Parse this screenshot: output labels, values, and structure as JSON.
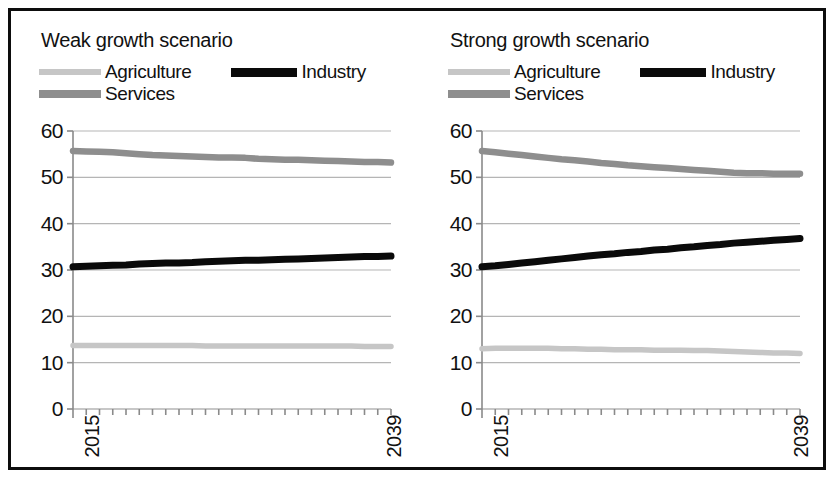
{
  "figure": {
    "panels": [
      {
        "id": "weak",
        "title": "Weak growth scenario",
        "legend": {
          "agriculture_label": "Agriculture",
          "industry_label": "Industry",
          "services_label": "Services"
        },
        "x_first_label": "2015",
        "x_last_label": "2039"
      },
      {
        "id": "strong",
        "title": "Strong growth scenario",
        "legend": {
          "agriculture_label": "Agriculture",
          "industry_label": "Industry",
          "services_label": "Services"
        },
        "x_first_label": "2015",
        "x_last_label": "2039"
      }
    ],
    "y_tick_labels": [
      "60",
      "50",
      "40",
      "30",
      "20",
      "10",
      "0"
    ],
    "colors": {
      "agriculture": "#c6c6c6",
      "industry": "#0a0a0a",
      "services": "#8e8e8e",
      "gridline": "#b5b5b5",
      "axis": "#8a8a8a",
      "frame": "#0d0d0d",
      "background": "#ffffff"
    }
  },
  "chart_data": [
    {
      "type": "line",
      "title": "Weak growth scenario",
      "xlabel": "",
      "ylabel": "",
      "xlim": [
        2015,
        2039
      ],
      "ylim": [
        0,
        60
      ],
      "yticks": [
        0,
        10,
        20,
        30,
        40,
        50,
        60
      ],
      "grid": true,
      "legend_position": "top",
      "x": [
        2015,
        2016,
        2017,
        2018,
        2019,
        2020,
        2021,
        2022,
        2023,
        2024,
        2025,
        2026,
        2027,
        2028,
        2029,
        2030,
        2031,
        2032,
        2033,
        2034,
        2035,
        2036,
        2037,
        2038,
        2039
      ],
      "series": [
        {
          "name": "Agriculture",
          "values": [
            13.7,
            13.7,
            13.7,
            13.7,
            13.7,
            13.7,
            13.7,
            13.7,
            13.7,
            13.7,
            13.6,
            13.6,
            13.6,
            13.6,
            13.6,
            13.6,
            13.6,
            13.6,
            13.6,
            13.6,
            13.6,
            13.6,
            13.5,
            13.5,
            13.5
          ]
        },
        {
          "name": "Industry",
          "values": [
            30.7,
            30.8,
            30.9,
            31.0,
            31.1,
            31.3,
            31.4,
            31.5,
            31.5,
            31.6,
            31.8,
            31.9,
            32.0,
            32.1,
            32.1,
            32.2,
            32.3,
            32.4,
            32.5,
            32.6,
            32.7,
            32.8,
            32.9,
            32.9,
            33.0
          ]
        },
        {
          "name": "Services",
          "values": [
            55.7,
            55.6,
            55.5,
            55.4,
            55.2,
            55.0,
            54.8,
            54.7,
            54.6,
            54.5,
            54.4,
            54.3,
            54.3,
            54.2,
            54.0,
            53.9,
            53.8,
            53.8,
            53.7,
            53.6,
            53.5,
            53.4,
            53.3,
            53.3,
            53.2
          ]
        }
      ]
    },
    {
      "type": "line",
      "title": "Strong growth scenario",
      "xlabel": "",
      "ylabel": "",
      "xlim": [
        2015,
        2039
      ],
      "ylim": [
        0,
        60
      ],
      "yticks": [
        0,
        10,
        20,
        30,
        40,
        50,
        60
      ],
      "grid": true,
      "legend_position": "top",
      "x": [
        2015,
        2016,
        2017,
        2018,
        2019,
        2020,
        2021,
        2022,
        2023,
        2024,
        2025,
        2026,
        2027,
        2028,
        2029,
        2030,
        2031,
        2032,
        2033,
        2034,
        2035,
        2036,
        2037,
        2038,
        2039
      ],
      "series": [
        {
          "name": "Agriculture",
          "values": [
            13.0,
            13.1,
            13.1,
            13.1,
            13.1,
            13.1,
            13.0,
            13.0,
            12.9,
            12.9,
            12.8,
            12.8,
            12.8,
            12.7,
            12.7,
            12.7,
            12.6,
            12.6,
            12.5,
            12.4,
            12.3,
            12.2,
            12.1,
            12.1,
            12.0
          ]
        },
        {
          "name": "Industry",
          "values": [
            30.7,
            30.9,
            31.2,
            31.5,
            31.8,
            32.1,
            32.4,
            32.7,
            33.0,
            33.3,
            33.5,
            33.8,
            34.0,
            34.3,
            34.5,
            34.8,
            35.0,
            35.3,
            35.5,
            35.8,
            36.0,
            36.2,
            36.4,
            36.6,
            36.8
          ]
        },
        {
          "name": "Services",
          "values": [
            55.7,
            55.4,
            55.1,
            54.8,
            54.5,
            54.2,
            53.9,
            53.7,
            53.4,
            53.1,
            52.9,
            52.6,
            52.4,
            52.2,
            52.0,
            51.8,
            51.6,
            51.4,
            51.2,
            51.0,
            50.9,
            50.9,
            50.8,
            50.8,
            50.8
          ]
        }
      ]
    }
  ]
}
